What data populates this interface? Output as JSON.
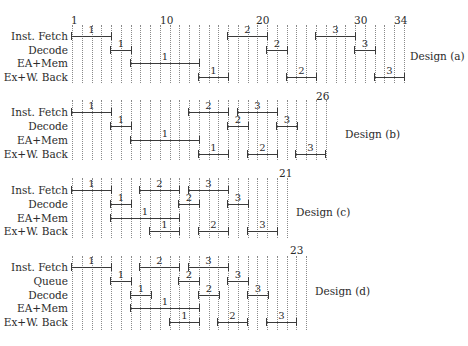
{
  "diagram": {
    "x0": 72,
    "step": 9.76,
    "designs": [
      {
        "id": "a",
        "label": "Design (a)",
        "label_pos": [
          410,
          50
        ],
        "grid": {
          "count": 35,
          "top": 25,
          "bottom": 83
        },
        "cycle_labels": [
          {
            "text": "1",
            "index": 0.2,
            "y": 14
          },
          {
            "text": "10",
            "index": 9.3,
            "y": 14
          },
          {
            "text": "20",
            "index": 19.2,
            "y": 14
          },
          {
            "text": "30",
            "index": 29.2,
            "y": 14
          },
          {
            "text": "34",
            "index": 33.3,
            "y": 14
          }
        ],
        "rows": [
          {
            "label": "Inst. Fetch",
            "y": 36
          },
          {
            "label": "Decode",
            "y": 50
          },
          {
            "label": "EA+Mem",
            "y": 63
          },
          {
            "label": "Ex+W. Back",
            "y": 77
          }
        ],
        "bars": [
          {
            "row": 0,
            "start": 0,
            "end": 4,
            "text": "1"
          },
          {
            "row": 1,
            "start": 4,
            "end": 6,
            "text": "1"
          },
          {
            "row": 2,
            "start": 6,
            "end": 13,
            "text": "1"
          },
          {
            "row": 3,
            "start": 13,
            "end": 16,
            "text": "1"
          },
          {
            "row": 0,
            "start": 16,
            "end": 20,
            "text": "2"
          },
          {
            "row": 1,
            "start": 20,
            "end": 22,
            "text": "2"
          },
          {
            "row": 3,
            "start": 22,
            "end": 25,
            "text": "2"
          },
          {
            "row": 0,
            "start": 25,
            "end": 29,
            "text": "3"
          },
          {
            "row": 1,
            "start": 29,
            "end": 31,
            "text": "3"
          },
          {
            "row": 3,
            "start": 31,
            "end": 34,
            "text": "3"
          }
        ]
      },
      {
        "id": "b",
        "label": "Design (b)",
        "label_pos": [
          345,
          128
        ],
        "grid": {
          "count": 27,
          "top": 100,
          "bottom": 160
        },
        "cycle_labels": [
          {
            "text": "26",
            "index": 25.3,
            "y": 90
          }
        ],
        "rows": [
          {
            "label": "Inst. Fetch",
            "y": 112
          },
          {
            "label": "Decode",
            "y": 126
          },
          {
            "label": "EA+Mem",
            "y": 140
          },
          {
            "label": "Ex+W. Back",
            "y": 154
          }
        ],
        "bars": [
          {
            "row": 0,
            "start": 0,
            "end": 4,
            "text": "1"
          },
          {
            "row": 1,
            "start": 4,
            "end": 6,
            "text": "1"
          },
          {
            "row": 2,
            "start": 6,
            "end": 13,
            "text": "1"
          },
          {
            "row": 3,
            "start": 13,
            "end": 16,
            "text": "1"
          },
          {
            "row": 0,
            "start": 12,
            "end": 16,
            "text": "2"
          },
          {
            "row": 1,
            "start": 16,
            "end": 18,
            "text": "2"
          },
          {
            "row": 3,
            "start": 18,
            "end": 21,
            "text": "2"
          },
          {
            "row": 0,
            "start": 17,
            "end": 21,
            "text": "3"
          },
          {
            "row": 1,
            "start": 21,
            "end": 23,
            "text": "3"
          },
          {
            "row": 3,
            "start": 23,
            "end": 26,
            "text": "3"
          }
        ]
      },
      {
        "id": "c",
        "label": "Design (c)",
        "label_pos": [
          296,
          206
        ],
        "grid": {
          "count": 23,
          "top": 178,
          "bottom": 238
        },
        "cycle_labels": [
          {
            "text": "21",
            "index": 21.5,
            "y": 167
          }
        ],
        "rows": [
          {
            "label": "Inst. Fetch",
            "y": 190
          },
          {
            "label": "Decode",
            "y": 204
          },
          {
            "label": "EA+Mem",
            "y": 218
          },
          {
            "label": "Ex+W. Back",
            "y": 231
          }
        ],
        "bars": [
          {
            "row": 0,
            "start": 0,
            "end": 4,
            "text": "1"
          },
          {
            "row": 1,
            "start": 4,
            "end": 6,
            "text": "1"
          },
          {
            "row": 2,
            "start": 4,
            "end": 11,
            "text": "1"
          },
          {
            "row": 3,
            "start": 8,
            "end": 11,
            "text": "1"
          },
          {
            "row": 0,
            "start": 7,
            "end": 11,
            "text": "2"
          },
          {
            "row": 1,
            "start": 11,
            "end": 13,
            "text": "2"
          },
          {
            "row": 3,
            "start": 13,
            "end": 16,
            "text": "2"
          },
          {
            "row": 0,
            "start": 12,
            "end": 16,
            "text": "3"
          },
          {
            "row": 1,
            "start": 16,
            "end": 18,
            "text": "3"
          },
          {
            "row": 3,
            "start": 18,
            "end": 21,
            "text": "3"
          }
        ]
      },
      {
        "id": "d",
        "label": "Design (d)",
        "label_pos": [
          315,
          285
        ],
        "grid": {
          "count": 25,
          "top": 256,
          "bottom": 330
        },
        "cycle_labels": [
          {
            "text": "23",
            "index": 22.6,
            "y": 244
          }
        ],
        "rows": [
          {
            "label": "Inst. Fetch",
            "y": 267
          },
          {
            "label": "Queue",
            "y": 281
          },
          {
            "label": "Decode",
            "y": 295
          },
          {
            "label": "EA+Mem",
            "y": 308
          },
          {
            "label": "Ex+W. Back",
            "y": 322
          }
        ],
        "bars": [
          {
            "row": 0,
            "start": 0,
            "end": 4,
            "text": "1"
          },
          {
            "row": 1,
            "start": 4,
            "end": 6,
            "text": "1"
          },
          {
            "row": 2,
            "start": 6,
            "end": 8,
            "text": "1"
          },
          {
            "row": 3,
            "start": 6,
            "end": 13,
            "text": "1"
          },
          {
            "row": 4,
            "start": 10,
            "end": 13,
            "text": "1"
          },
          {
            "row": 0,
            "start": 7,
            "end": 11,
            "text": "2"
          },
          {
            "row": 1,
            "start": 11,
            "end": 13,
            "text": "2"
          },
          {
            "row": 2,
            "start": 13,
            "end": 15,
            "text": "2"
          },
          {
            "row": 4,
            "start": 15,
            "end": 18,
            "text": "2"
          },
          {
            "row": 0,
            "start": 12,
            "end": 16,
            "text": "3"
          },
          {
            "row": 1,
            "start": 16,
            "end": 18,
            "text": "3"
          },
          {
            "row": 2,
            "start": 18,
            "end": 20,
            "text": "3"
          },
          {
            "row": 4,
            "start": 20,
            "end": 23,
            "text": "3"
          }
        ]
      }
    ]
  }
}
